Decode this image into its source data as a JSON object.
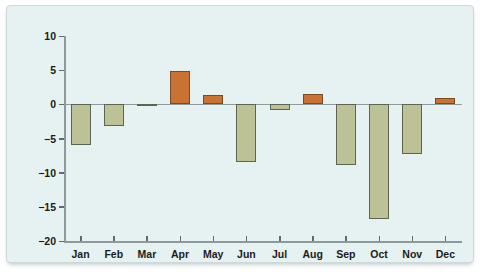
{
  "chart_data": {
    "type": "bar",
    "title": "",
    "subtitle": "",
    "xlabel": "",
    "ylabel": "",
    "categories": [
      "Jan",
      "Feb",
      "Mar",
      "Apr",
      "May",
      "Jun",
      "Jul",
      "Aug",
      "Sep",
      "Oct",
      "Nov",
      "Dec"
    ],
    "values": [
      -6.0,
      -3.2,
      -0.3,
      4.9,
      1.3,
      -8.5,
      -0.9,
      1.5,
      -8.9,
      -16.8,
      -7.2,
      1.0
    ],
    "ylim": [
      -20,
      10
    ],
    "yticks": [
      10,
      5,
      0,
      -5,
      -10,
      -15,
      -20
    ],
    "ytick_labels": [
      "10",
      "5",
      "0",
      "−5",
      "−10",
      "−15",
      "−20"
    ],
    "grid": false,
    "legend": "none",
    "colors": {
      "positive_bar": "#c87334",
      "negative_bar": "#bcc296",
      "positive_bar_edge": "#7a4a20",
      "negative_bar_edge": "#5c6552",
      "panel_background": "#e6f1f1",
      "axis": "#8d9a9c",
      "tick_label": "#1b1b1b"
    }
  }
}
